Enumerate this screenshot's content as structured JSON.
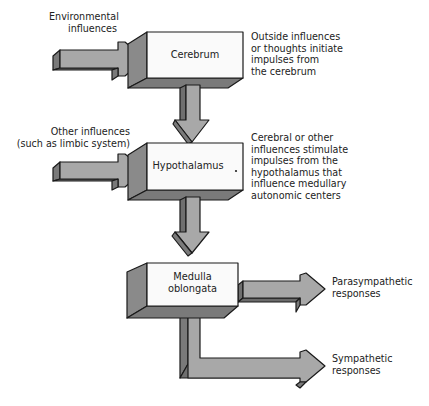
{
  "diagram": {
    "nodes": [
      {
        "id": "cerebrum",
        "label": "Cerebrum"
      },
      {
        "id": "hypothalamus",
        "label": "Hypothalamus"
      },
      {
        "id": "medulla",
        "label": "Medulla\noblongata"
      }
    ],
    "inputs": [
      {
        "id": "environmental",
        "label": "Environmental\ninfluences",
        "target": "cerebrum"
      },
      {
        "id": "other",
        "label": "Other influences\n(such as limbic system)",
        "target": "hypothalamus"
      }
    ],
    "outputs": [
      {
        "id": "parasympathetic",
        "label": "Parasympathetic\nresponses",
        "source": "medulla"
      },
      {
        "id": "sympathetic",
        "label": "Sympathetic\nresponses",
        "source": "medulla"
      }
    ],
    "annotations": [
      {
        "id": "cerebrum-note",
        "text": "Outside influences\nor thoughts initiate\nimpulses from\nthe cerebrum"
      },
      {
        "id": "hypothalamus-note",
        "text": "Cerebral or other\ninfluences stimulate\nimpulses from the\nhypothalamus that\ninfluence medullary\nautonomic centers"
      }
    ],
    "edges": [
      {
        "from": "environmental",
        "to": "cerebrum"
      },
      {
        "from": "cerebrum",
        "to": "hypothalamus"
      },
      {
        "from": "other",
        "to": "hypothalamus"
      },
      {
        "from": "hypothalamus",
        "to": "medulla"
      },
      {
        "from": "medulla",
        "to": "parasympathetic"
      },
      {
        "from": "medulla",
        "to": "sympathetic"
      }
    ]
  },
  "colors": {
    "face": "#fafafa",
    "side": "#8a8a8a",
    "arrow_top": "#a8a8a8",
    "arrow_side": "#7a7a7a",
    "outline": "#1a1a1a"
  }
}
